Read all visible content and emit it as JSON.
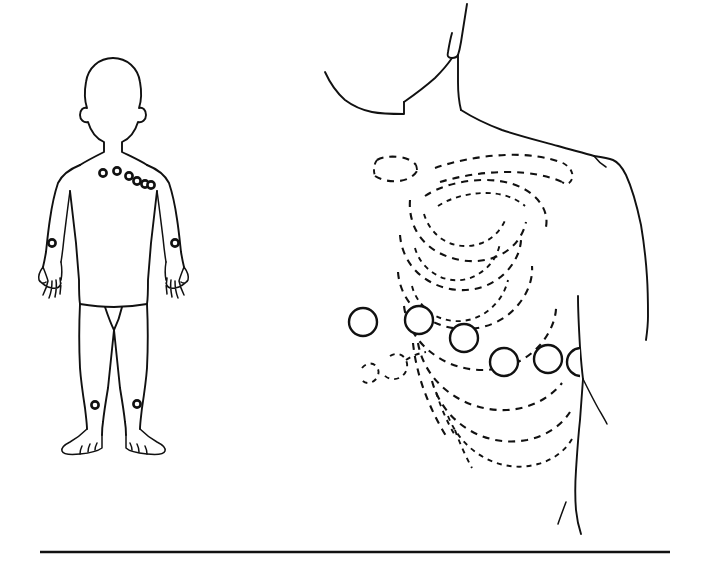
{
  "illustration": {
    "title": "ECG electrode placement",
    "subject": "Precordial and limb lead electrode positions on the human torso",
    "style": "black-and-white line drawing",
    "background_color": "#ffffff",
    "ink_color": "#111111",
    "has_text_labels": false,
    "panels": [
      {
        "id": "full-body",
        "name": "full-body-figure",
        "description": "Anterior view of a standing human figure with electrodes marked",
        "position": "left"
      },
      {
        "id": "chest-detail",
        "name": "chest-detail-figure",
        "description": "Close-up of the left anterior chest with the rib cage shown as dashed lines and six precordial electrodes",
        "position": "right"
      }
    ]
  },
  "full_body": {
    "chest_electrodes": [
      {
        "name": "v1",
        "cx": 103,
        "cy": 173,
        "r": 3.6
      },
      {
        "name": "v2",
        "cx": 117,
        "cy": 171,
        "r": 3.6
      },
      {
        "name": "v3",
        "cx": 129,
        "cy": 176,
        "r": 3.6
      },
      {
        "name": "v4",
        "cx": 137,
        "cy": 181,
        "r": 3.6
      },
      {
        "name": "v5",
        "cx": 145,
        "cy": 184,
        "r": 3.6
      },
      {
        "name": "v6",
        "cx": 151,
        "cy": 185,
        "r": 3.6
      }
    ],
    "limb_electrodes": [
      {
        "name": "right-arm",
        "cx": 52,
        "cy": 243,
        "r": 3.6
      },
      {
        "name": "left-arm",
        "cx": 175,
        "cy": 243,
        "r": 3.6
      },
      {
        "name": "right-leg",
        "cx": 95,
        "cy": 405,
        "r": 3.6
      },
      {
        "name": "left-leg",
        "cx": 137,
        "cy": 404,
        "r": 3.6
      }
    ],
    "electrode_count": 10
  },
  "chest_detail": {
    "precordial_electrodes": [
      {
        "name": "v1",
        "cx": 363,
        "cy": 322,
        "r": 14
      },
      {
        "name": "v2",
        "cx": 419,
        "cy": 320,
        "r": 14
      },
      {
        "name": "v3",
        "cx": 464,
        "cy": 338,
        "r": 14
      },
      {
        "name": "v4",
        "cx": 504,
        "cy": 362,
        "r": 14
      },
      {
        "name": "v5",
        "cx": 548,
        "cy": 359,
        "r": 14
      },
      {
        "name": "v6",
        "cx": 581,
        "cy": 362,
        "r": 14
      }
    ],
    "electrode_count": 6,
    "anatomy_shown": [
      "clavicle",
      "ribs",
      "costal-margin",
      "sternum",
      "shoulder",
      "neck",
      "chin"
    ]
  },
  "footer": {
    "rule_present": true,
    "rule_y": 552
  }
}
